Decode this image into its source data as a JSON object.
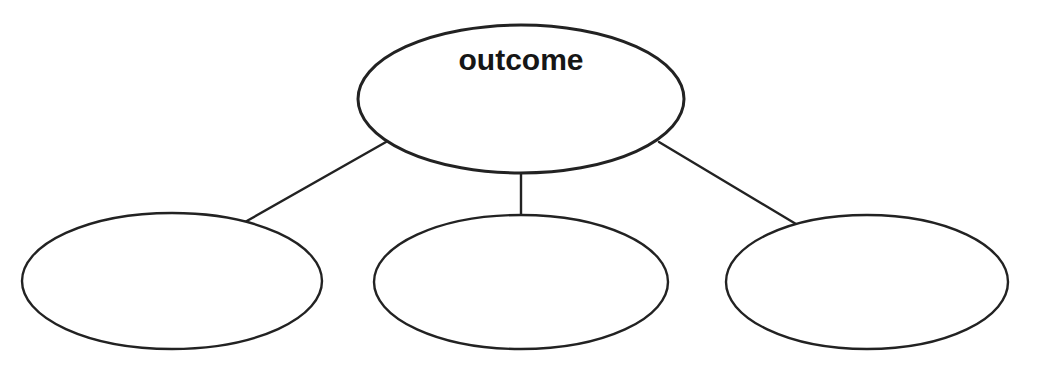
{
  "diagram": {
    "type": "tree-diagram",
    "title": "",
    "background_color": "#ffffff",
    "stroke_color": "#222222",
    "text_color": "#161616",
    "canvas": {
      "width": 1038,
      "height": 372
    },
    "nodes": [
      {
        "id": "root",
        "role": "parent-node",
        "label": "outcome",
        "label_visible": true,
        "label_bold": true,
        "label_font_size": 30,
        "shape": "ellipse",
        "cx": 521,
        "cy": 99,
        "rx": 163,
        "ry": 74,
        "stroke_width": 3,
        "label_x": 521,
        "label_y": 70
      },
      {
        "id": "child-1",
        "role": "child-node",
        "label": "",
        "label_visible": false,
        "label_bold": false,
        "label_font_size": 30,
        "shape": "ellipse",
        "cx": 172,
        "cy": 281,
        "rx": 150,
        "ry": 68,
        "stroke_width": 2.4,
        "label_x": 172,
        "label_y": 291
      },
      {
        "id": "child-2",
        "role": "child-node",
        "label": "",
        "label_visible": false,
        "label_bold": false,
        "label_font_size": 30,
        "shape": "ellipse",
        "cx": 521,
        "cy": 282,
        "rx": 147,
        "ry": 67,
        "stroke_width": 2.4,
        "label_x": 521,
        "label_y": 292
      },
      {
        "id": "child-3",
        "role": "child-node",
        "label": "",
        "label_visible": false,
        "label_bold": false,
        "label_font_size": 30,
        "shape": "ellipse",
        "cx": 867,
        "cy": 282,
        "rx": 141,
        "ry": 67,
        "stroke_width": 2.4,
        "label_x": 867,
        "label_y": 292
      }
    ],
    "connectors": [
      {
        "id": "root-to-child-1",
        "from": "root",
        "to": "child-1",
        "x1": 386,
        "y1": 142,
        "x2": 245,
        "y2": 222,
        "stroke_width": 2.4
      },
      {
        "id": "root-to-child-2",
        "from": "root",
        "to": "child-2",
        "x1": 521,
        "y1": 172,
        "x2": 521,
        "y2": 222,
        "stroke_width": 2.4
      },
      {
        "id": "root-to-child-3",
        "from": "root",
        "to": "child-3",
        "x1": 659,
        "y1": 142,
        "x2": 801,
        "y2": 227,
        "stroke_width": 2.4
      }
    ]
  }
}
